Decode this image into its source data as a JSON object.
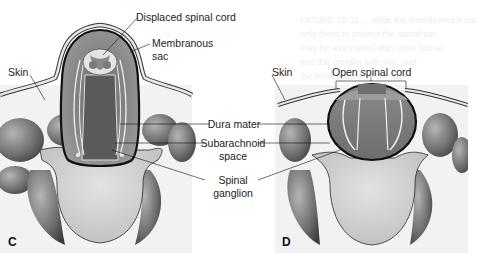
{
  "figure": {
    "panels": [
      {
        "letter": "C",
        "labels": {
          "displaced_cord": "Displaced spinal cord",
          "membranous_sac_1": "Membranous",
          "membranous_sac_2": "sac",
          "skin": "Skin"
        }
      },
      {
        "letter": "D",
        "labels": {
          "skin": "Skin",
          "open_cord": "Open spinal cord"
        }
      }
    ],
    "shared_labels": {
      "dura": "Dura mater",
      "subarachnoid_1": "Subarachnoid",
      "subarachnoid_2": "space",
      "ganglion_1": "Spinal",
      "ganglion_2": "ganglion"
    },
    "bleed_text": [
      "FIGURE 15-11 ... while the membranous sac",
      "only there to protect the spinal sac",
      "may be associated with other tissue",
      "and the ganglia with sac, and",
      "the form bone and the skin"
    ],
    "colors": {
      "background": "#f4f4f4",
      "muscle_dark": "#555555",
      "muscle_light": "#a8a8a8",
      "body_fill": "#cfcfcf",
      "sac_fill": "#7c7c7c",
      "outline": "#1a1a1a",
      "skin": "#e8e8e8"
    }
  }
}
